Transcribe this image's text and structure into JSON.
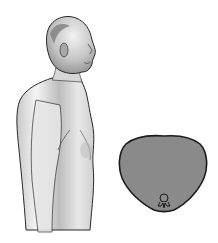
{
  "illustration": {
    "subject": "elderly man in lateral profile view, shirtless, rounded upper back and forward-protruding chest",
    "figure_icon": "person-profile-icon",
    "cross_section": {
      "icon": "thorax-cross-section-icon",
      "shape": "barrel-shaped (rounded) thorax",
      "fill_color": "#8a8a8a",
      "outline_color": "#1a1a1a",
      "vertebra_icon": "vertebra-icon"
    }
  },
  "colors": {
    "background": "#ffffff",
    "skin_light": "#f2f2f2",
    "skin_shade": "#9a9a9a",
    "line": "#2a2a2a"
  }
}
